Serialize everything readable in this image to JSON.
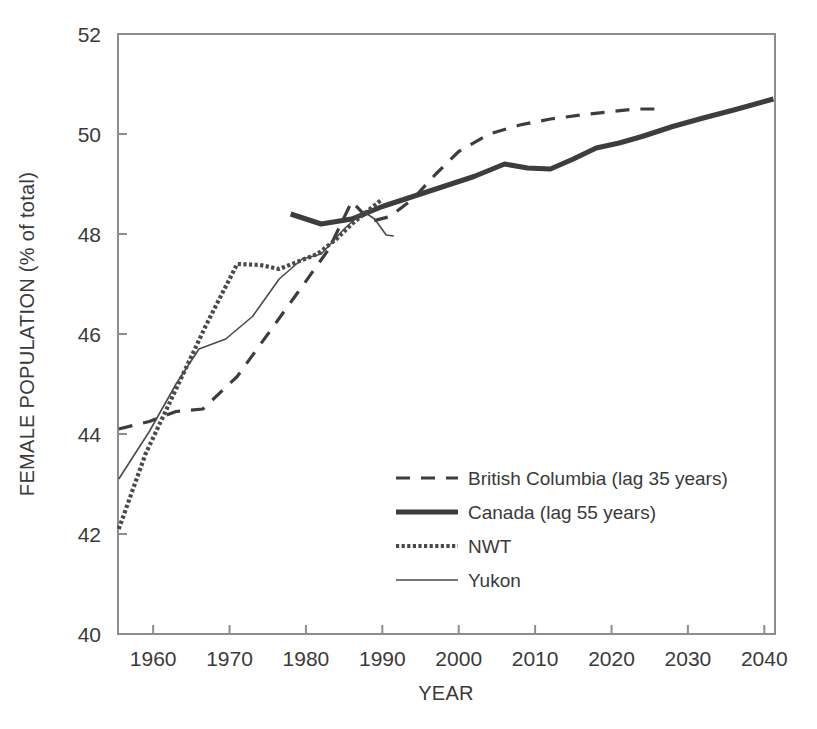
{
  "chart_data": {
    "type": "line",
    "title": "",
    "xlabel": "YEAR",
    "ylabel": "FEMALE POPULATION (% of total)",
    "xlim": [
      1955.4,
      2041.4
    ],
    "ylim": [
      40,
      52
    ],
    "xticks": [
      1960,
      1970,
      1980,
      1990,
      2000,
      2010,
      2020,
      2030,
      2040
    ],
    "xtick_labels": [
      "1960",
      "1970",
      "1980",
      "1990",
      "2000",
      "2010",
      "2020",
      "2030",
      "2040"
    ],
    "yticks": [
      40,
      42,
      44,
      46,
      48,
      50,
      52
    ],
    "ytick_labels": [
      "40",
      "42",
      "44",
      "46",
      "48",
      "50",
      "52"
    ],
    "grid": false,
    "legend_position": "lower-right-inside",
    "series": [
      {
        "name": "British Columbia (lag 35 years)",
        "style": "dashed",
        "color": "#3d3d3d",
        "width": 3.2,
        "x": [
          1955.5,
          1959.5,
          1963.0,
          1966.5,
          1971.0,
          1975.5,
          1979.5,
          1983.0,
          1986.0,
          1988.5,
          1991.0,
          1994.0,
          1997.0,
          2000.0,
          2004.0,
          2008.0,
          2012.0,
          2016.0,
          2020.0,
          2023.0,
          2026.0
        ],
        "y": [
          44.1,
          44.25,
          44.45,
          44.5,
          45.15,
          46.1,
          46.95,
          47.7,
          48.65,
          48.25,
          48.35,
          48.7,
          49.2,
          49.65,
          50.0,
          50.18,
          50.3,
          50.38,
          50.45,
          50.5,
          50.5
        ]
      },
      {
        "name": "Canada (lag 55 years)",
        "style": "solid-thick",
        "color": "#3d3d3d",
        "width": 5.0,
        "x": [
          1978.0,
          1982.0,
          1986.0,
          1990.0,
          1994.0,
          1998.0,
          2002.0,
          2006.0,
          2009.0,
          2012.0,
          2015.0,
          2018.0,
          2021.0,
          2024.0,
          2028.0,
          2032.0,
          2036.0,
          2041.2
        ],
        "y": [
          48.4,
          48.2,
          48.3,
          48.55,
          48.75,
          48.95,
          49.15,
          49.4,
          49.32,
          49.3,
          49.5,
          49.72,
          49.82,
          49.95,
          50.15,
          50.32,
          50.48,
          50.7
        ]
      },
      {
        "name": "NWT",
        "style": "dotted-thick",
        "color": "#4a4a4a",
        "width": 4.2,
        "x": [
          1955.5,
          1959.0,
          1963.0,
          1967.0,
          1971.0,
          1974.0,
          1976.5,
          1979.0,
          1981.5,
          1984.0,
          1986.0,
          1988.0,
          1990.0
        ],
        "y": [
          42.1,
          43.6,
          44.9,
          46.2,
          47.4,
          47.38,
          47.3,
          47.45,
          47.6,
          47.9,
          48.2,
          48.45,
          48.7
        ]
      },
      {
        "name": "Yukon",
        "style": "solid-thin",
        "color": "#4a4a4a",
        "width": 1.6,
        "x": [
          1955.5,
          1959.5,
          1963.0,
          1966.0,
          1969.5,
          1973.0,
          1976.5,
          1979.5,
          1982.0,
          1985.0,
          1987.5,
          1989.0,
          1990.5,
          1991.5
        ],
        "y": [
          43.1,
          44.05,
          45.0,
          45.7,
          45.9,
          46.35,
          47.1,
          47.5,
          47.6,
          48.1,
          48.45,
          48.3,
          47.98,
          47.96
        ]
      }
    ]
  },
  "legend": {
    "entries": [
      {
        "label": "British Columbia (lag 35 years)",
        "sample": "dashed-line-sample"
      },
      {
        "label": "Canada (lag 55 years)",
        "sample": "thick-line-sample"
      },
      {
        "label": "NWT",
        "sample": "dotted-line-sample"
      },
      {
        "label": "Yukon",
        "sample": "thin-line-sample"
      }
    ]
  },
  "colors": {
    "ink": "#3d3d3d",
    "axis": "#8a8a8a",
    "background": "#ffffff"
  }
}
